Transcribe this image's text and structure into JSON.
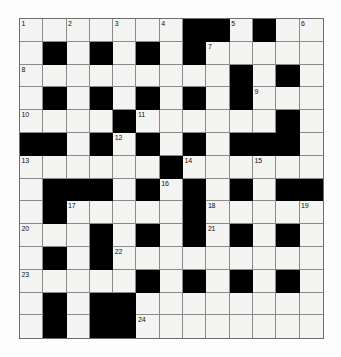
{
  "puzzle": {
    "type": "crossword-grid",
    "title": "",
    "rows": 14,
    "cols": 13,
    "cell_size_px": 23,
    "colors": {
      "white_cell": "#f4f4f2",
      "black_cell": "#000000",
      "grid_line": "#8a8a8a",
      "border": "#6e6e6e",
      "number_text": "#111111",
      "page_background": "#fdfdfd"
    },
    "black_cells": [
      [
        0,
        7
      ],
      [
        0,
        8
      ],
      [
        0,
        10
      ],
      [
        1,
        1
      ],
      [
        1,
        3
      ],
      [
        1,
        5
      ],
      [
        1,
        7
      ],
      [
        2,
        9
      ],
      [
        2,
        11
      ],
      [
        3,
        1
      ],
      [
        3,
        3
      ],
      [
        3,
        5
      ],
      [
        3,
        7
      ],
      [
        3,
        9
      ],
      [
        4,
        4
      ],
      [
        4,
        11
      ],
      [
        5,
        0
      ],
      [
        5,
        1
      ],
      [
        5,
        3
      ],
      [
        5,
        5
      ],
      [
        5,
        7
      ],
      [
        5,
        9
      ],
      [
        5,
        10
      ],
      [
        5,
        11
      ],
      [
        6,
        6
      ],
      [
        7,
        1
      ],
      [
        7,
        2
      ],
      [
        7,
        3
      ],
      [
        7,
        5
      ],
      [
        7,
        7
      ],
      [
        7,
        9
      ],
      [
        7,
        11
      ],
      [
        7,
        12
      ],
      [
        8,
        1
      ],
      [
        8,
        7
      ],
      [
        9,
        3
      ],
      [
        9,
        5
      ],
      [
        9,
        7
      ],
      [
        9,
        9
      ],
      [
        9,
        11
      ],
      [
        10,
        1
      ],
      [
        10,
        3
      ],
      [
        11,
        5
      ],
      [
        11,
        7
      ],
      [
        11,
        9
      ],
      [
        11,
        11
      ],
      [
        12,
        1
      ],
      [
        12,
        3
      ],
      [
        12,
        4
      ],
      [
        13,
        1
      ],
      [
        13,
        3
      ],
      [
        13,
        4
      ]
    ],
    "numbered_cells": [
      {
        "number": "1",
        "row": 0,
        "col": 0
      },
      {
        "number": "2",
        "row": 0,
        "col": 2
      },
      {
        "number": "3",
        "row": 0,
        "col": 4
      },
      {
        "number": "4",
        "row": 0,
        "col": 6
      },
      {
        "number": "5",
        "row": 0,
        "col": 9
      },
      {
        "number": "6",
        "row": 0,
        "col": 12
      },
      {
        "number": "7",
        "row": 1,
        "col": 8
      },
      {
        "number": "8",
        "row": 2,
        "col": 0
      },
      {
        "number": "9",
        "row": 3,
        "col": 10
      },
      {
        "number": "10",
        "row": 4,
        "col": 0
      },
      {
        "number": "11",
        "row": 4,
        "col": 5
      },
      {
        "number": "12",
        "row": 5,
        "col": 4
      },
      {
        "number": "13",
        "row": 6,
        "col": 0
      },
      {
        "number": "14",
        "row": 6,
        "col": 7
      },
      {
        "number": "15",
        "row": 6,
        "col": 10
      },
      {
        "number": "16",
        "row": 7,
        "col": 6
      },
      {
        "number": "17",
        "row": 8,
        "col": 2
      },
      {
        "number": "18",
        "row": 8,
        "col": 8
      },
      {
        "number": "19",
        "row": 8,
        "col": 12
      },
      {
        "number": "20",
        "row": 9,
        "col": 0
      },
      {
        "number": "21",
        "row": 9,
        "col": 8
      },
      {
        "number": "22",
        "row": 10,
        "col": 4
      },
      {
        "number": "23",
        "row": 11,
        "col": 0
      },
      {
        "number": "24",
        "row": 13,
        "col": 5
      }
    ]
  }
}
